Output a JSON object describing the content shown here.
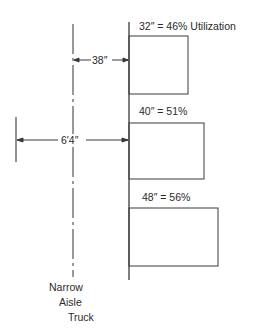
{
  "diagram": {
    "type": "aisle-width-utilization",
    "truck_label": [
      "Narrow",
      "Aisle",
      "Truck"
    ],
    "dimensions": {
      "truck_to_rack": "38″",
      "overall_width": "6′4″"
    },
    "racks": [
      {
        "label": "32″ = 46% Utilization",
        "depth_in": 32,
        "utilization_pct": 46
      },
      {
        "label": "40″ = 51%",
        "depth_in": 40,
        "utilization_pct": 51
      },
      {
        "label": "48″ = 56%",
        "depth_in": 48,
        "utilization_pct": 56
      }
    ],
    "colors": {
      "line": "#3a3a3a",
      "background": "#ffffff"
    }
  }
}
